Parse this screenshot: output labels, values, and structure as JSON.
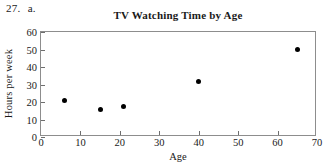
{
  "problem": {
    "number": "27.",
    "part": "a."
  },
  "chart_data": {
    "type": "scatter",
    "title": "TV Watching Time by Age",
    "xlabel": "Age",
    "ylabel": "Hours per week",
    "xlim": [
      0,
      70
    ],
    "ylim": [
      0,
      60
    ],
    "xticks": [
      0,
      10,
      20,
      30,
      40,
      50,
      60,
      70
    ],
    "yticks": [
      0,
      10,
      20,
      30,
      40,
      50,
      60
    ],
    "grid": false,
    "legend": null,
    "marker": "filled-circle",
    "marker_color": "#000000",
    "points": [
      {
        "x": 6,
        "y": 21
      },
      {
        "x": 15,
        "y": 16
      },
      {
        "x": 21,
        "y": 17.5
      },
      {
        "x": 40,
        "y": 32
      },
      {
        "x": 65,
        "y": 50
      }
    ],
    "x": [
      6,
      15,
      21,
      40,
      65
    ],
    "y": [
      21,
      16,
      17.5,
      32,
      50
    ]
  }
}
